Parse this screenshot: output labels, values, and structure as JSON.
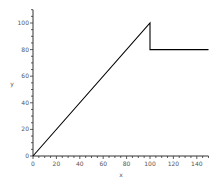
{
  "chart_data": {
    "type": "line",
    "title": "",
    "xlabel": "x",
    "ylabel": "y",
    "xlim": [
      0,
      150
    ],
    "ylim": [
      0,
      110
    ],
    "grid": false,
    "legend": null,
    "x_ticks": [
      0,
      20,
      40,
      60,
      80,
      100,
      120,
      140
    ],
    "y_ticks": [
      0,
      20,
      40,
      60,
      80,
      100
    ],
    "x_tick_labels": [
      "0",
      "20",
      "40",
      "60",
      "80",
      "100",
      "120",
      "140"
    ],
    "y_tick_labels": [
      "0",
      "20",
      "40",
      "60",
      "80",
      "100"
    ],
    "series": [
      {
        "name": "y",
        "color": "#000000",
        "x": [
          0,
          100,
          100,
          150
        ],
        "y": [
          0,
          100,
          80,
          80
        ]
      }
    ]
  },
  "labels": {
    "x_axis": "x",
    "y_axis": "y"
  }
}
